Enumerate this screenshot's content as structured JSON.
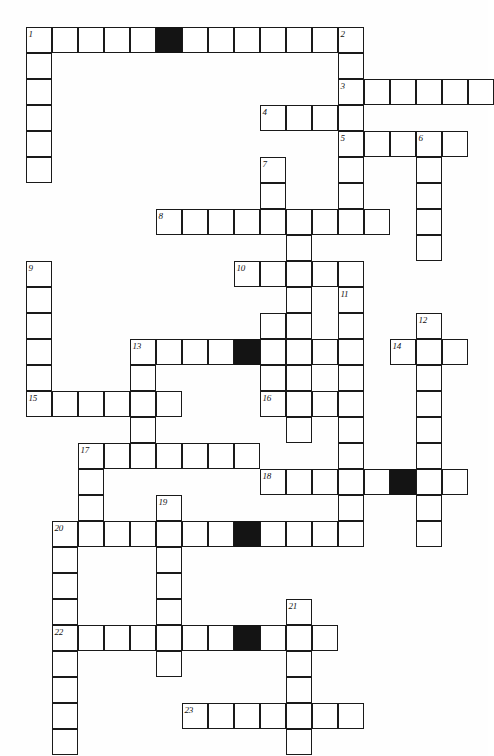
{
  "puzzle": {
    "title": "Crossword Puzzle Grid",
    "type": "crossword-grid",
    "cell_size": 26,
    "origin": {
      "x": 26,
      "y": 27
    },
    "colors": {
      "paper": "#fefefe",
      "cell_fill": "#ffffff",
      "block_fill": "#141414",
      "ink": "#1a1a1a"
    },
    "counts": {
      "clue_numbers": 23,
      "blocked_cells": 6
    }
  },
  "entries": [
    {
      "number": "1",
      "direction": "across",
      "row": 0,
      "col": 0,
      "length": 13
    },
    {
      "number": "1",
      "direction": "down",
      "row": 0,
      "col": 0,
      "length": 6
    },
    {
      "number": "2",
      "direction": "down",
      "row": 0,
      "col": 12,
      "length": 5
    },
    {
      "number": "3",
      "direction": "across",
      "row": 2,
      "col": 12,
      "length": 6
    },
    {
      "number": "4",
      "direction": "across",
      "row": 3,
      "col": 9,
      "length": 4
    },
    {
      "number": "5",
      "direction": "across",
      "row": 4,
      "col": 12,
      "length": 5
    },
    {
      "number": "5",
      "direction": "down",
      "row": 4,
      "col": 12,
      "length": 4
    },
    {
      "number": "6",
      "direction": "down",
      "row": 4,
      "col": 15,
      "length": 5
    },
    {
      "number": "7",
      "direction": "down",
      "row": 5,
      "col": 9,
      "length": 4
    },
    {
      "number": "8",
      "direction": "across",
      "row": 7,
      "col": 5,
      "length": 9
    },
    {
      "number": "9",
      "direction": "down",
      "row": 9,
      "col": 0,
      "length": 6
    },
    {
      "number": "10",
      "direction": "across",
      "row": 9,
      "col": 8,
      "length": 5
    },
    {
      "number": "11",
      "direction": "down",
      "row": 10,
      "col": 12,
      "length": 8
    },
    {
      "number": "12",
      "direction": "down",
      "row": 11,
      "col": 15,
      "length": 5
    },
    {
      "number": "13",
      "direction": "across",
      "row": 12,
      "col": 4,
      "length": 8
    },
    {
      "number": "13",
      "direction": "down",
      "row": 12,
      "col": 4,
      "length": 4
    },
    {
      "number": "14",
      "direction": "across",
      "row": 12,
      "col": 14,
      "length": 3
    },
    {
      "number": "15",
      "direction": "across",
      "row": 14,
      "col": 0,
      "length": 6
    },
    {
      "number": "16",
      "direction": "across",
      "row": 14,
      "col": 9,
      "length": 4
    },
    {
      "number": "17",
      "direction": "across",
      "row": 16,
      "col": 2,
      "length": 7
    },
    {
      "number": "17",
      "direction": "down",
      "row": 16,
      "col": 2,
      "length": 4
    },
    {
      "number": "18",
      "direction": "across",
      "row": 17,
      "col": 9,
      "length": 8
    },
    {
      "number": "19",
      "direction": "down",
      "row": 18,
      "col": 5,
      "length": 7
    },
    {
      "number": "20",
      "direction": "across",
      "row": 19,
      "col": 1,
      "length": 11
    },
    {
      "number": "20",
      "direction": "down",
      "row": 19,
      "col": 1,
      "length": 5
    },
    {
      "number": "21",
      "direction": "down",
      "row": 22,
      "col": 10,
      "length": 6
    },
    {
      "number": "22",
      "direction": "across",
      "row": 23,
      "col": 1,
      "length": 11
    },
    {
      "number": "22",
      "direction": "down",
      "row": 23,
      "col": 1,
      "length": 5
    },
    {
      "number": "23",
      "direction": "across",
      "row": 26,
      "col": 6,
      "length": 7
    }
  ],
  "cells": [
    {
      "r": 0,
      "c": 0,
      "black": false
    },
    {
      "r": 0,
      "c": 1,
      "black": false
    },
    {
      "r": 0,
      "c": 2,
      "black": false
    },
    {
      "r": 0,
      "c": 3,
      "black": false
    },
    {
      "r": 0,
      "c": 4,
      "black": false
    },
    {
      "r": 0,
      "c": 5,
      "black": true
    },
    {
      "r": 0,
      "c": 6,
      "black": false
    },
    {
      "r": 0,
      "c": 7,
      "black": false
    },
    {
      "r": 0,
      "c": 8,
      "black": false
    },
    {
      "r": 0,
      "c": 9,
      "black": false
    },
    {
      "r": 0,
      "c": 10,
      "black": false
    },
    {
      "r": 0,
      "c": 11,
      "black": false
    },
    {
      "r": 0,
      "c": 12,
      "black": false
    },
    {
      "r": 1,
      "c": 0,
      "black": false
    },
    {
      "r": 1,
      "c": 12,
      "black": false
    },
    {
      "r": 2,
      "c": 0,
      "black": false
    },
    {
      "r": 2,
      "c": 12,
      "black": false
    },
    {
      "r": 2,
      "c": 13,
      "black": false
    },
    {
      "r": 2,
      "c": 14,
      "black": false
    },
    {
      "r": 2,
      "c": 15,
      "black": false
    },
    {
      "r": 2,
      "c": 16,
      "black": false
    },
    {
      "r": 2,
      "c": 17,
      "black": false
    },
    {
      "r": 3,
      "c": 0,
      "black": false
    },
    {
      "r": 3,
      "c": 9,
      "black": false
    },
    {
      "r": 3,
      "c": 10,
      "black": false
    },
    {
      "r": 3,
      "c": 11,
      "black": false
    },
    {
      "r": 3,
      "c": 12,
      "black": false
    },
    {
      "r": 4,
      "c": 0,
      "black": false
    },
    {
      "r": 4,
      "c": 12,
      "black": false
    },
    {
      "r": 4,
      "c": 13,
      "black": false
    },
    {
      "r": 4,
      "c": 14,
      "black": false
    },
    {
      "r": 4,
      "c": 15,
      "black": false
    },
    {
      "r": 4,
      "c": 16,
      "black": false
    },
    {
      "r": 5,
      "c": 0,
      "black": false
    },
    {
      "r": 5,
      "c": 9,
      "black": false
    },
    {
      "r": 5,
      "c": 12,
      "black": false
    },
    {
      "r": 5,
      "c": 15,
      "black": false
    },
    {
      "r": 6,
      "c": 9,
      "black": false
    },
    {
      "r": 6,
      "c": 12,
      "black": false
    },
    {
      "r": 6,
      "c": 15,
      "black": false
    },
    {
      "r": 7,
      "c": 5,
      "black": false
    },
    {
      "r": 7,
      "c": 6,
      "black": false
    },
    {
      "r": 7,
      "c": 7,
      "black": false
    },
    {
      "r": 7,
      "c": 8,
      "black": false
    },
    {
      "r": 7,
      "c": 9,
      "black": false
    },
    {
      "r": 7,
      "c": 10,
      "black": false
    },
    {
      "r": 7,
      "c": 11,
      "black": false
    },
    {
      "r": 7,
      "c": 12,
      "black": false
    },
    {
      "r": 7,
      "c": 13,
      "black": false
    },
    {
      "r": 7,
      "c": 15,
      "black": false
    },
    {
      "r": 8,
      "c": 10,
      "black": false
    },
    {
      "r": 8,
      "c": 15,
      "black": false
    },
    {
      "r": 9,
      "c": 0,
      "black": false
    },
    {
      "r": 9,
      "c": 8,
      "black": false
    },
    {
      "r": 9,
      "c": 9,
      "black": false
    },
    {
      "r": 9,
      "c": 10,
      "black": false
    },
    {
      "r": 9,
      "c": 11,
      "black": false
    },
    {
      "r": 9,
      "c": 12,
      "black": false
    },
    {
      "r": 10,
      "c": 0,
      "black": false
    },
    {
      "r": 10,
      "c": 10,
      "black": false
    },
    {
      "r": 10,
      "c": 12,
      "black": false
    },
    {
      "r": 11,
      "c": 0,
      "black": false
    },
    {
      "r": 11,
      "c": 9,
      "black": false
    },
    {
      "r": 11,
      "c": 10,
      "black": false
    },
    {
      "r": 11,
      "c": 12,
      "black": false
    },
    {
      "r": 11,
      "c": 15,
      "black": false
    },
    {
      "r": 12,
      "c": 0,
      "black": false
    },
    {
      "r": 12,
      "c": 4,
      "black": false
    },
    {
      "r": 12,
      "c": 5,
      "black": false
    },
    {
      "r": 12,
      "c": 6,
      "black": false
    },
    {
      "r": 12,
      "c": 7,
      "black": false
    },
    {
      "r": 12,
      "c": 8,
      "black": true
    },
    {
      "r": 12,
      "c": 9,
      "black": false
    },
    {
      "r": 12,
      "c": 10,
      "black": false
    },
    {
      "r": 12,
      "c": 11,
      "black": false
    },
    {
      "r": 12,
      "c": 12,
      "black": false
    },
    {
      "r": 12,
      "c": 14,
      "black": false
    },
    {
      "r": 12,
      "c": 15,
      "black": false
    },
    {
      "r": 12,
      "c": 16,
      "black": false
    },
    {
      "r": 13,
      "c": 0,
      "black": false
    },
    {
      "r": 13,
      "c": 4,
      "black": false
    },
    {
      "r": 13,
      "c": 9,
      "black": false
    },
    {
      "r": 13,
      "c": 10,
      "black": false
    },
    {
      "r": 13,
      "c": 12,
      "black": false
    },
    {
      "r": 13,
      "c": 15,
      "black": false
    },
    {
      "r": 14,
      "c": 0,
      "black": false
    },
    {
      "r": 14,
      "c": 1,
      "black": false
    },
    {
      "r": 14,
      "c": 2,
      "black": false
    },
    {
      "r": 14,
      "c": 3,
      "black": false
    },
    {
      "r": 14,
      "c": 4,
      "black": false
    },
    {
      "r": 14,
      "c": 5,
      "black": false
    },
    {
      "r": 14,
      "c": 9,
      "black": false
    },
    {
      "r": 14,
      "c": 10,
      "black": false
    },
    {
      "r": 14,
      "c": 11,
      "black": false
    },
    {
      "r": 14,
      "c": 12,
      "black": false
    },
    {
      "r": 14,
      "c": 15,
      "black": false
    },
    {
      "r": 15,
      "c": 4,
      "black": false
    },
    {
      "r": 15,
      "c": 10,
      "black": false
    },
    {
      "r": 15,
      "c": 12,
      "black": false
    },
    {
      "r": 15,
      "c": 15,
      "black": false
    },
    {
      "r": 16,
      "c": 2,
      "black": false
    },
    {
      "r": 16,
      "c": 3,
      "black": false
    },
    {
      "r": 16,
      "c": 4,
      "black": false
    },
    {
      "r": 16,
      "c": 5,
      "black": false
    },
    {
      "r": 16,
      "c": 6,
      "black": false
    },
    {
      "r": 16,
      "c": 7,
      "black": false
    },
    {
      "r": 16,
      "c": 8,
      "black": false
    },
    {
      "r": 16,
      "c": 12,
      "black": false
    },
    {
      "r": 16,
      "c": 15,
      "black": false
    },
    {
      "r": 17,
      "c": 2,
      "black": false
    },
    {
      "r": 17,
      "c": 9,
      "black": false
    },
    {
      "r": 17,
      "c": 10,
      "black": false
    },
    {
      "r": 17,
      "c": 11,
      "black": false
    },
    {
      "r": 17,
      "c": 12,
      "black": false
    },
    {
      "r": 17,
      "c": 13,
      "black": false
    },
    {
      "r": 17,
      "c": 14,
      "black": true
    },
    {
      "r": 17,
      "c": 15,
      "black": false
    },
    {
      "r": 17,
      "c": 16,
      "black": false
    },
    {
      "r": 18,
      "c": 2,
      "black": false
    },
    {
      "r": 18,
      "c": 5,
      "black": false
    },
    {
      "r": 18,
      "c": 12,
      "black": false
    },
    {
      "r": 18,
      "c": 15,
      "black": false
    },
    {
      "r": 19,
      "c": 1,
      "black": false
    },
    {
      "r": 19,
      "c": 2,
      "black": false
    },
    {
      "r": 19,
      "c": 3,
      "black": false
    },
    {
      "r": 19,
      "c": 4,
      "black": false
    },
    {
      "r": 19,
      "c": 5,
      "black": false
    },
    {
      "r": 19,
      "c": 6,
      "black": false
    },
    {
      "r": 19,
      "c": 7,
      "black": false
    },
    {
      "r": 19,
      "c": 8,
      "black": true
    },
    {
      "r": 19,
      "c": 9,
      "black": false
    },
    {
      "r": 19,
      "c": 10,
      "black": false
    },
    {
      "r": 19,
      "c": 11,
      "black": false
    },
    {
      "r": 19,
      "c": 12,
      "black": false
    },
    {
      "r": 19,
      "c": 15,
      "black": false
    },
    {
      "r": 20,
      "c": 1,
      "black": false
    },
    {
      "r": 20,
      "c": 5,
      "black": false
    },
    {
      "r": 21,
      "c": 1,
      "black": false
    },
    {
      "r": 21,
      "c": 5,
      "black": false
    },
    {
      "r": 22,
      "c": 1,
      "black": false
    },
    {
      "r": 22,
      "c": 5,
      "black": false
    },
    {
      "r": 22,
      "c": 10,
      "black": false
    },
    {
      "r": 23,
      "c": 1,
      "black": false
    },
    {
      "r": 23,
      "c": 2,
      "black": false
    },
    {
      "r": 23,
      "c": 3,
      "black": false
    },
    {
      "r": 23,
      "c": 4,
      "black": false
    },
    {
      "r": 23,
      "c": 5,
      "black": false
    },
    {
      "r": 23,
      "c": 6,
      "black": false
    },
    {
      "r": 23,
      "c": 7,
      "black": false
    },
    {
      "r": 23,
      "c": 8,
      "black": true
    },
    {
      "r": 23,
      "c": 9,
      "black": false
    },
    {
      "r": 23,
      "c": 10,
      "black": false
    },
    {
      "r": 23,
      "c": 11,
      "black": false
    },
    {
      "r": 24,
      "c": 1,
      "black": false
    },
    {
      "r": 24,
      "c": 5,
      "black": false
    },
    {
      "r": 24,
      "c": 10,
      "black": false
    },
    {
      "r": 25,
      "c": 1,
      "black": false
    },
    {
      "r": 25,
      "c": 10,
      "black": false
    },
    {
      "r": 26,
      "c": 1,
      "black": false
    },
    {
      "r": 26,
      "c": 6,
      "black": false
    },
    {
      "r": 26,
      "c": 7,
      "black": false
    },
    {
      "r": 26,
      "c": 8,
      "black": false
    },
    {
      "r": 26,
      "c": 9,
      "black": false
    },
    {
      "r": 26,
      "c": 10,
      "black": false
    },
    {
      "r": 26,
      "c": 11,
      "black": false
    },
    {
      "r": 26,
      "c": 12,
      "black": false
    },
    {
      "r": 27,
      "c": 1,
      "black": false
    },
    {
      "r": 27,
      "c": 10,
      "black": false
    }
  ],
  "numbers": [
    {
      "label": "1",
      "r": 0,
      "c": 0
    },
    {
      "label": "2",
      "r": 0,
      "c": 12
    },
    {
      "label": "3",
      "r": 2,
      "c": 12
    },
    {
      "label": "4",
      "r": 3,
      "c": 9
    },
    {
      "label": "5",
      "r": 4,
      "c": 12
    },
    {
      "label": "6",
      "r": 4,
      "c": 15
    },
    {
      "label": "7",
      "r": 5,
      "c": 9
    },
    {
      "label": "8",
      "r": 7,
      "c": 5
    },
    {
      "label": "9",
      "r": 9,
      "c": 0
    },
    {
      "label": "10",
      "r": 9,
      "c": 8
    },
    {
      "label": "11",
      "r": 10,
      "c": 12
    },
    {
      "label": "12",
      "r": 11,
      "c": 15
    },
    {
      "label": "13",
      "r": 12,
      "c": 4
    },
    {
      "label": "14",
      "r": 12,
      "c": 14
    },
    {
      "label": "15",
      "r": 14,
      "c": 0
    },
    {
      "label": "16",
      "r": 14,
      "c": 9
    },
    {
      "label": "17",
      "r": 16,
      "c": 2
    },
    {
      "label": "18",
      "r": 17,
      "c": 9
    },
    {
      "label": "19",
      "r": 18,
      "c": 5
    },
    {
      "label": "20",
      "r": 19,
      "c": 1
    },
    {
      "label": "21",
      "r": 22,
      "c": 10
    },
    {
      "label": "22",
      "r": 23,
      "c": 1
    },
    {
      "label": "23",
      "r": 26,
      "c": 6
    }
  ]
}
